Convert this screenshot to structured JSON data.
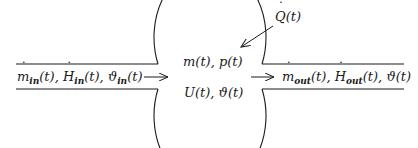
{
  "diagram": {
    "type": "control-volume-flow",
    "vessel": {
      "state_line_1": "m(t), p(t)",
      "state_line_2": "U(t), ϑ(t)"
    },
    "inflow": {
      "label": "ṁ_in(t), Ḣ_in(t), ϑ_in(t)",
      "parts": {
        "m": "m",
        "m_sub": "in",
        "m_t": "(t), ",
        "H": "H",
        "H_sub": "in",
        "H_t": "(t), ",
        "theta": "ϑ",
        "theta_sub": "in",
        "theta_t": "(t)"
      }
    },
    "outflow": {
      "label": "ṁ_out(t), Ḣ_out(t), ϑ(t)",
      "parts": {
        "m": "m",
        "m_sub": "out",
        "m_t": "(t), ",
        "H": "H",
        "H_sub": "out",
        "H_t": "(t), ",
        "theta_t": "ϑ(t)"
      }
    },
    "heat": {
      "label": "Q̇(t)",
      "parts": {
        "Q": "Q",
        "Q_t": "(t)"
      }
    },
    "colors": {
      "stroke": "#1a1a1a",
      "background": "#ffffff"
    }
  }
}
